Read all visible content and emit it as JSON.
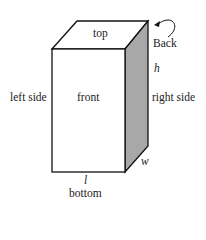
{
  "diagram": {
    "type": "rectangular box (cuboid) with labeled faces and dimensions",
    "faces": {
      "top": "top",
      "front": "front",
      "left": "left side",
      "right": "right side",
      "bottom": "bottom",
      "back": "Back"
    },
    "dimensions": {
      "height": "h",
      "width": "w",
      "length": "l"
    },
    "colors": {
      "stroke": "#111111",
      "right_face_fill": "#a8a8a8",
      "background": "#ffffff"
    }
  }
}
